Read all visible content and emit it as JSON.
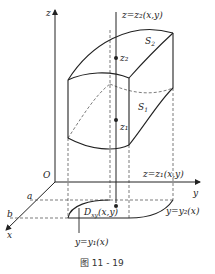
{
  "figure": {
    "caption": "图 11 - 19",
    "axes": {
      "z": "z",
      "y": "y",
      "x": "x",
      "origin": "O"
    },
    "x_marks": {
      "a": "a",
      "b": "b"
    },
    "surfaces": {
      "top_name": "S",
      "top_sub": "2",
      "bottom_name": "S",
      "bottom_sub": "1",
      "top_eq": "z=z₂(x,y)",
      "bottom_eq": "z=z₁(x,y)"
    },
    "points": {
      "z2": "z₂",
      "z1": "z₁"
    },
    "region": {
      "label": "D",
      "sub": "xy",
      "args": "(x,y)"
    },
    "curves": {
      "y2": "y=y₂(x)",
      "y1": "y=y₁(x)"
    }
  },
  "colors": {
    "stroke": "#222222",
    "dash": "#444444",
    "background": "#ffffff"
  }
}
